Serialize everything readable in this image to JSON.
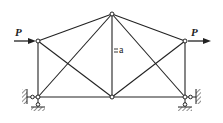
{
  "diagram": {
    "type": "truss",
    "colors": {
      "stroke": "#222222",
      "background": "#ffffff",
      "hatch": "#444444"
    },
    "nodes": [
      {
        "id": "left-top",
        "x": 38,
        "y": 41
      },
      {
        "id": "left-bottom",
        "x": 38,
        "y": 97
      },
      {
        "id": "top-center",
        "x": 112,
        "y": 14
      },
      {
        "id": "bottom-center",
        "x": 112,
        "y": 97
      },
      {
        "id": "right-top",
        "x": 185,
        "y": 41
      },
      {
        "id": "right-bottom",
        "x": 185,
        "y": 97
      }
    ],
    "members": [
      [
        "left-top",
        "left-bottom"
      ],
      [
        "left-top",
        "top-center"
      ],
      [
        "left-top",
        "bottom-center"
      ],
      [
        "left-bottom",
        "top-center"
      ],
      [
        "left-bottom",
        "bottom-center"
      ],
      [
        "top-center",
        "bottom-center"
      ],
      [
        "top-center",
        "right-top"
      ],
      [
        "top-center",
        "right-bottom"
      ],
      [
        "bottom-center",
        "right-top"
      ],
      [
        "bottom-center",
        "right-bottom"
      ],
      [
        "right-top",
        "right-bottom"
      ]
    ],
    "loads": [
      {
        "label": "P",
        "node": "left-top",
        "direction": "right"
      },
      {
        "label": "P",
        "node": "right-top",
        "direction": "right"
      }
    ],
    "dimension_label": "a",
    "supports": [
      {
        "node": "left-bottom",
        "type": "pin-wall-and-ground",
        "wall_side": "left"
      },
      {
        "node": "right-bottom",
        "type": "pin-wall-and-ground",
        "wall_side": "right"
      }
    ]
  }
}
